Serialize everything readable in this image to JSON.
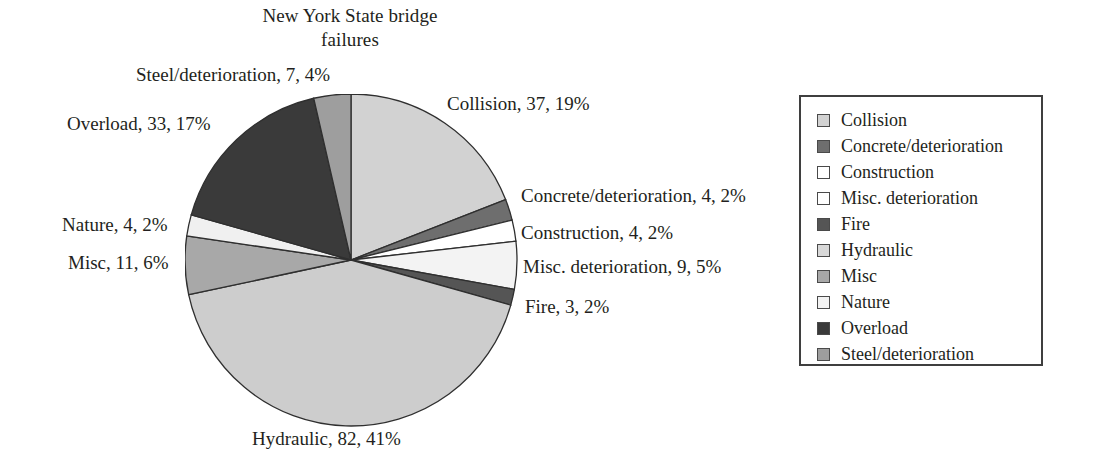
{
  "chart_data": {
    "type": "pie",
    "title": "New York State bridge failures",
    "title_lines": [
      "New York State bridge",
      "failures"
    ],
    "xlabel": "",
    "ylabel": "",
    "total": 194,
    "legend_position": "right",
    "grid": false,
    "start_angle_deg": 0,
    "direction": "clockwise",
    "categories": [
      "Collision",
      "Concrete/deterioration",
      "Construction",
      "Misc. deterioration",
      "Fire",
      "Hydraulic",
      "Misc",
      "Nature",
      "Overload",
      "Steel/deterioration"
    ],
    "values": [
      37,
      4,
      4,
      9,
      3,
      82,
      11,
      4,
      33,
      7
    ],
    "percents": [
      19,
      2,
      2,
      5,
      2,
      41,
      6,
      2,
      17,
      4
    ],
    "colors": [
      "#d2d2d2",
      "#6e6e6e",
      "#ffffff",
      "#f3f3f3",
      "#555555",
      "#cdcdcd",
      "#a8a8a8",
      "#f0f0f0",
      "#3a3a3a",
      "#9e9e9e"
    ],
    "slice_outline_color": "#2f2f2f",
    "slices": [
      {
        "label": "Collision",
        "value": 37,
        "percent": 19,
        "color": "#d2d2d2"
      },
      {
        "label": "Concrete/deterioration",
        "value": 4,
        "percent": 2,
        "color": "#6e6e6e"
      },
      {
        "label": "Construction",
        "value": 4,
        "percent": 2,
        "color": "#ffffff"
      },
      {
        "label": "Misc. deterioration",
        "value": 9,
        "percent": 5,
        "color": "#f3f3f3"
      },
      {
        "label": "Fire",
        "value": 3,
        "percent": 2,
        "color": "#555555"
      },
      {
        "label": "Hydraulic",
        "value": 82,
        "percent": 41,
        "color": "#cdcdcd"
      },
      {
        "label": "Misc",
        "value": 11,
        "percent": 6,
        "color": "#a8a8a8"
      },
      {
        "label": "Nature",
        "value": 4,
        "percent": 2,
        "color": "#f0f0f0"
      },
      {
        "label": "Overload",
        "value": 33,
        "percent": 17,
        "color": "#3a3a3a"
      },
      {
        "label": "Steel/deterioration",
        "value": 7,
        "percent": 4,
        "color": "#9e9e9e"
      }
    ]
  },
  "data_labels": [
    {
      "text": "Steel/deterioration, 7, 4%",
      "align": "left",
      "x": 136,
      "y": 64
    },
    {
      "text": "Collision, 37, 19%",
      "align": "left",
      "x": 447,
      "y": 93
    },
    {
      "text": "Overload, 33, 17%",
      "align": "left",
      "x": 67,
      "y": 113
    },
    {
      "text": "Concrete/deterioration, 4, 2%",
      "align": "left",
      "x": 521,
      "y": 185
    },
    {
      "text": "Construction, 4, 2%",
      "align": "left",
      "x": 521,
      "y": 222
    },
    {
      "text": "Nature, 4, 2%",
      "align": "left",
      "x": 62,
      "y": 214
    },
    {
      "text": "Misc, 11, 6%",
      "align": "left",
      "x": 68,
      "y": 252
    },
    {
      "text": "Misc. deterioration, 9, 5%",
      "align": "left",
      "x": 523,
      "y": 256
    },
    {
      "text": "Fire, 3, 2%",
      "align": "left",
      "x": 525,
      "y": 296
    },
    {
      "text": "Hydraulic, 82, 41%",
      "align": "left",
      "x": 252,
      "y": 428
    }
  ],
  "legend": {
    "items": [
      {
        "label": "Collision",
        "color": "#d2d2d2"
      },
      {
        "label": "Concrete/deterioration",
        "color": "#6e6e6e"
      },
      {
        "label": "Construction",
        "color": "#ffffff"
      },
      {
        "label": "Misc. deterioration",
        "color": "#ffffff"
      },
      {
        "label": "Fire",
        "color": "#555555"
      },
      {
        "label": "Hydraulic",
        "color": "#d8d8d8"
      },
      {
        "label": "Misc",
        "color": "#a8a8a8"
      },
      {
        "label": "Nature",
        "color": "#f2f2f2"
      },
      {
        "label": "Overload",
        "color": "#3a3a3a"
      },
      {
        "label": "Steel/deterioration",
        "color": "#9e9e9e"
      }
    ]
  },
  "geometry": {
    "center_x": 351,
    "center_y": 260,
    "radius": 166
  }
}
